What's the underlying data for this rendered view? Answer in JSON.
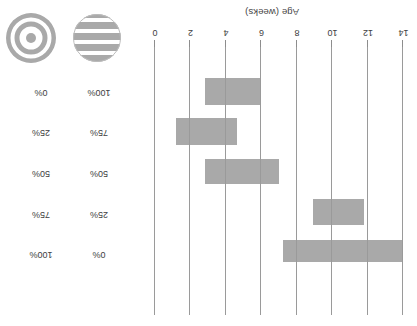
{
  "chart_data": {
    "type": "bar",
    "orientation": "horizontal",
    "title": "",
    "xlabel": "Age (weeks)",
    "ylabel": "",
    "xlim": [
      14,
      0
    ],
    "axis_reversed": true,
    "grid": true,
    "xticks": [
      14,
      12,
      10,
      8,
      6,
      4,
      2,
      0
    ],
    "xtick_labels": [
      "14",
      "12",
      "10",
      "8",
      "6",
      "4",
      "2",
      "0"
    ],
    "bar_color": "#a9a9a9",
    "gridline_color": "#9a9a9a",
    "categories": [
      "Bar 1",
      "Bar 2",
      "Bar 3",
      "Bar 4",
      "Bar 5"
    ],
    "bars": [
      {
        "label": "Bar 1",
        "start_weeks": 14.0,
        "end_weeks": 7.2
      },
      {
        "label": "Bar 2",
        "start_weeks": 11.8,
        "end_weeks": 8.9
      },
      {
        "label": "Bar 3",
        "start_weeks": 7.0,
        "end_weeks": 2.8
      },
      {
        "label": "Bar 4",
        "start_weeks": 4.6,
        "end_weeks": 1.2
      },
      {
        "label": "Bar 5",
        "start_weeks": 5.9,
        "end_weeks": 2.8
      }
    ]
  },
  "axis": {
    "title": "Age (weeks)",
    "tick_labels": [
      "14",
      "12",
      "10",
      "8",
      "6",
      "4",
      "2",
      "0"
    ]
  },
  "percent_table": {
    "rows": [
      {
        "left": "0%",
        "right": "100%"
      },
      {
        "left": "25%",
        "right": "75%"
      },
      {
        "left": "50%",
        "right": "50%"
      },
      {
        "left": "75%",
        "right": "25%"
      },
      {
        "left": "100%",
        "right": "0%"
      }
    ]
  },
  "icons": {
    "striped": "striped-circle-icon",
    "bullseye": "bullseye-circle-icon",
    "color": "#a9a9a9"
  }
}
